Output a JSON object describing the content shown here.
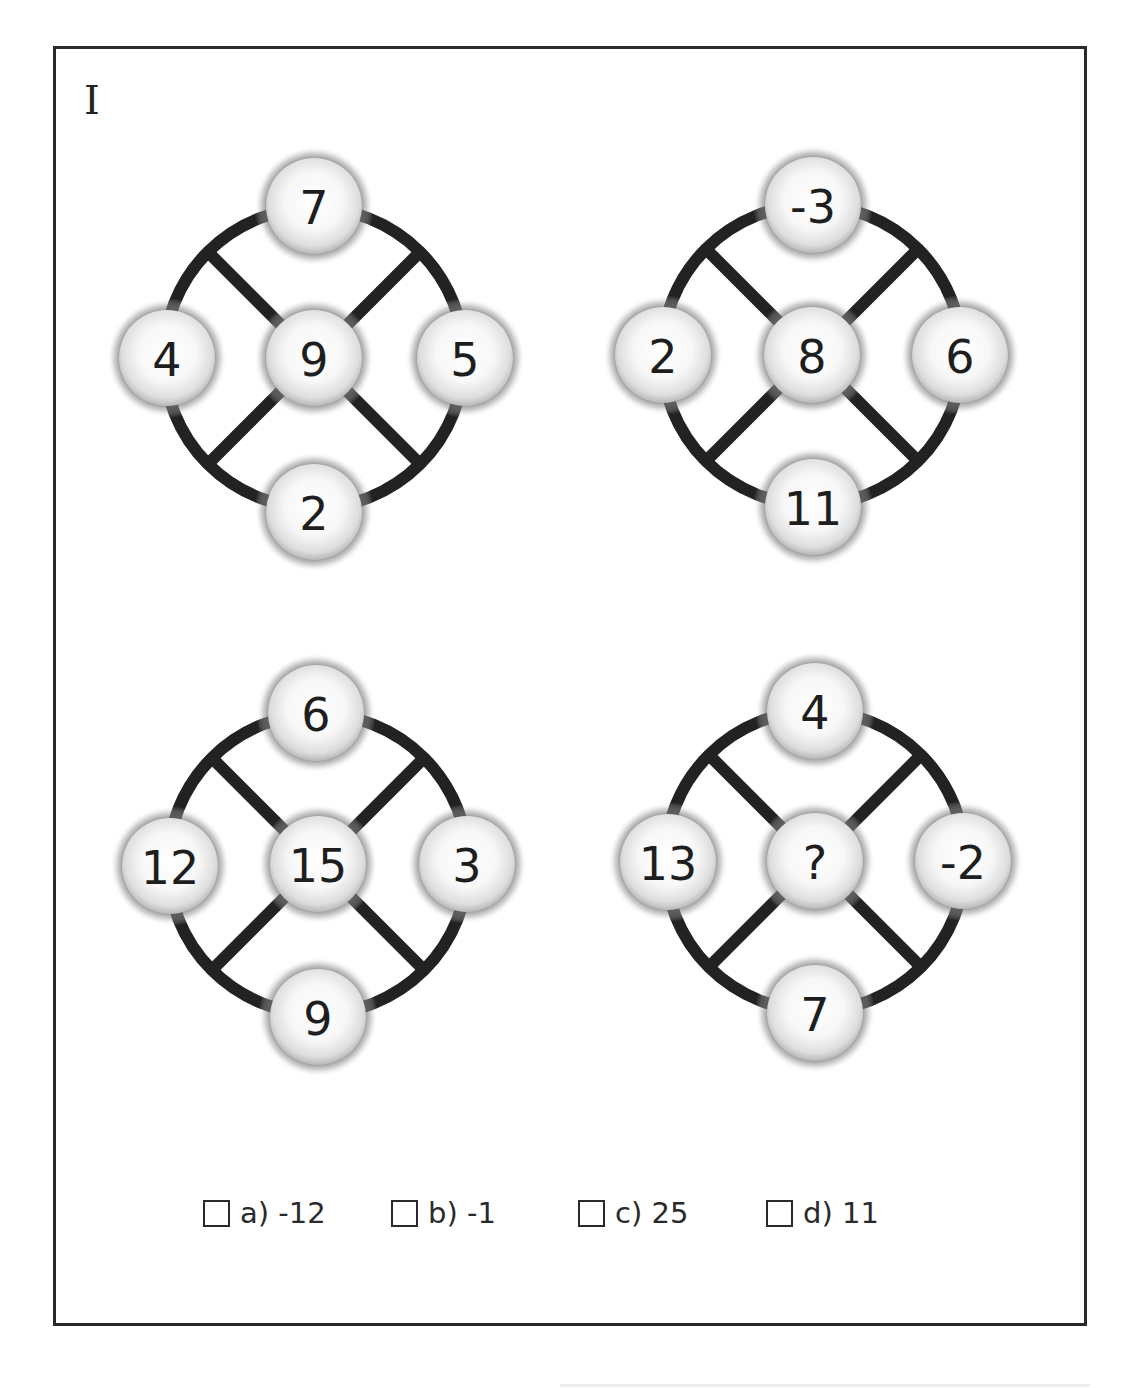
{
  "page": {
    "label": "I",
    "colors": {
      "stroke": "#222222",
      "node_fill_center": "#ffffff",
      "node_fill_edge": "#bdbdbd",
      "text": "#1e1e1e",
      "frame": "#2a2a2a"
    }
  },
  "puzzles": [
    {
      "id": "puzzle-1",
      "position": "top-left",
      "center": "9",
      "top": "7",
      "left": "4",
      "right": "5",
      "bottom": "2"
    },
    {
      "id": "puzzle-2",
      "position": "top-right",
      "center": "8",
      "top": "-3",
      "left": "2",
      "right": "6",
      "bottom": "11"
    },
    {
      "id": "puzzle-3",
      "position": "bottom-left",
      "center": "15",
      "top": "6",
      "left": "12",
      "right": "3",
      "bottom": "9"
    },
    {
      "id": "puzzle-4",
      "position": "bottom-right",
      "center": "?",
      "top": "4",
      "left": "13",
      "right": "-2",
      "bottom": "7"
    }
  ],
  "options": [
    {
      "letter": "a)",
      "value": "-12",
      "label": "a) -12",
      "checked": false
    },
    {
      "letter": "b)",
      "value": "-1",
      "label": "b) -1",
      "checked": false
    },
    {
      "letter": "c)",
      "value": "25",
      "label": "c) 25",
      "checked": false
    },
    {
      "letter": "d)",
      "value": "11",
      "label": "d) 11",
      "checked": false
    }
  ]
}
